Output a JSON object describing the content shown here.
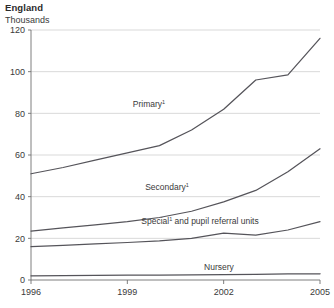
{
  "header": {
    "region": "England",
    "unit": "Thousands"
  },
  "chart_data": {
    "type": "line",
    "title": "England",
    "subtitle": "Thousands",
    "xlabel": "",
    "ylabel": "Thousands",
    "xlim": [
      1996,
      2005
    ],
    "ylim": [
      0,
      120
    ],
    "grid": true,
    "legend_position": "inline-labels",
    "x": [
      1996,
      1997,
      1998,
      1999,
      2000,
      2001,
      2002,
      2003,
      2004,
      2005
    ],
    "xticks": [
      "1996",
      "1999",
      "2002",
      "2005"
    ],
    "xtick_values": [
      1996,
      1999,
      2002,
      2005
    ],
    "yticks": [
      "0",
      "20",
      "40",
      "60",
      "80",
      "100",
      "120"
    ],
    "ytick_values": [
      0,
      20,
      40,
      60,
      80,
      100,
      120
    ],
    "series": [
      {
        "name": "Primary",
        "label": "Primary",
        "label_superscript": "1",
        "color": "#55545a",
        "values": [
          51,
          54,
          57.5,
          61,
          64.5,
          72,
          82,
          96,
          98.5,
          116
        ]
      },
      {
        "name": "Secondary",
        "label": "Secondary",
        "label_superscript": "1",
        "color": "#55545a",
        "values": [
          23.5,
          25,
          26.5,
          28,
          30,
          33,
          37.5,
          43,
          52,
          63
        ]
      },
      {
        "name": "Special and pupil referral units",
        "label": "Special",
        "label_superscript": "1",
        "label_suffix": " and pupil referral units",
        "color": "#55545a",
        "values": [
          16,
          16.6,
          17.3,
          18,
          18.8,
          20,
          22.5,
          21.5,
          24,
          28
        ]
      },
      {
        "name": "Nursery",
        "label": "Nursery",
        "label_superscript": "",
        "color": "#55545a",
        "values": [
          2,
          2.1,
          2.2,
          2.3,
          2.4,
          2.5,
          2.6,
          2.7,
          2.9,
          3
        ]
      }
    ],
    "annotations": [
      {
        "text": "Primary",
        "superscript": "1",
        "x": 149,
        "y": 107
      },
      {
        "text": "Secondary",
        "superscript": "1",
        "x": 167,
        "y": 190
      },
      {
        "text": "Special",
        "superscript": "1",
        "suffix": " and pupil referral units",
        "x": 200,
        "y": 224
      },
      {
        "text": "Nursery",
        "superscript": "",
        "x": 219,
        "y": 270
      }
    ]
  }
}
